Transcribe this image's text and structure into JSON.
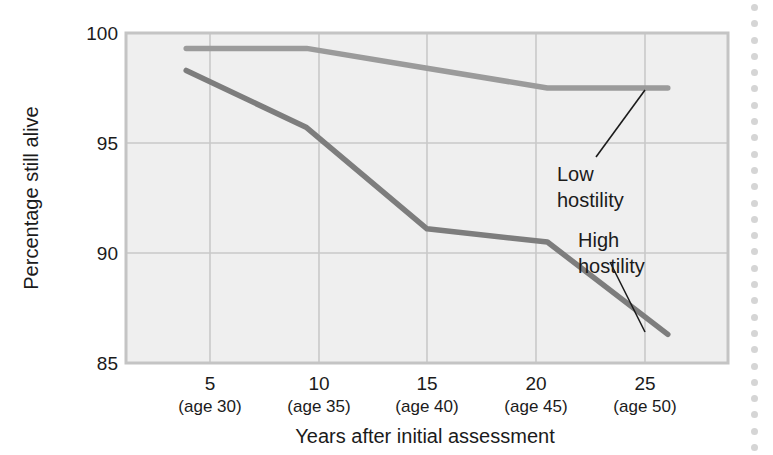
{
  "figure": {
    "background_color": "#ffffff",
    "plot_background_color": "#efefef",
    "grid_color": "#c9c9c9",
    "axis_frame_color": "#c4c4c4"
  },
  "chart_data": {
    "type": "line",
    "title": "",
    "xlabel": "Years after initial assessment",
    "ylabel": "Percentage still alive",
    "x": [
      5,
      10,
      15,
      20,
      25
    ],
    "categories": [
      "5",
      "10",
      "15",
      "20",
      "25"
    ],
    "category_sublabels": [
      "(age 30)",
      "(age 35)",
      "(age 40)",
      "(age 45)",
      "(age 50)"
    ],
    "xlim": [
      2.5,
      27.5
    ],
    "ylim": [
      85,
      100
    ],
    "yticks": [
      85,
      90,
      95,
      100
    ],
    "ytick_labels": [
      "85",
      "90",
      "95",
      "100"
    ],
    "grid": true,
    "legend": "annotated-callouts",
    "series": [
      {
        "name": "Low hostility",
        "color": "#9b9b9b",
        "values": [
          99.3,
          99.3,
          98.4,
          97.5,
          97.5
        ]
      },
      {
        "name": "High hostility",
        "color": "#7d7d7d",
        "values": [
          98.3,
          95.7,
          91.1,
          90.5,
          86.3
        ]
      }
    ],
    "annotations": [
      {
        "text_line1": "Low",
        "text_line2": "hostility",
        "points_to_series": "Low hostility",
        "points_to_x": 25
      },
      {
        "text_line1": "High",
        "text_line2": "hostility",
        "points_to_series": "High hostility",
        "points_to_x": 25
      }
    ]
  },
  "axis": {
    "y_labels": [
      "100",
      "95",
      "90",
      "85"
    ],
    "y_title": "Percentage still alive",
    "x_title": "Years after initial assessment",
    "x_labels": [
      "5",
      "10",
      "15",
      "20",
      "25"
    ],
    "x_sublabels": [
      "(age 30)",
      "(age 35)",
      "(age 40)",
      "(age 45)",
      "(age 50)"
    ]
  },
  "callouts": {
    "low": {
      "line1": "Low",
      "line2": "hostility"
    },
    "high": {
      "line1": "High",
      "line2": "hostility"
    }
  }
}
